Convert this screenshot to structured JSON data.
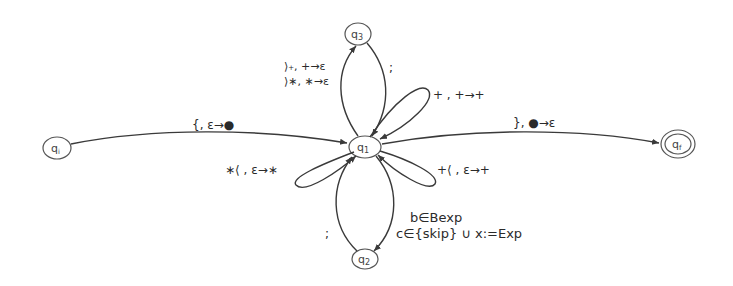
{
  "diagram": {
    "type": "pushdown automaton",
    "states": [
      {
        "id": "qi",
        "label": "qᵢ",
        "initial": true,
        "final": false
      },
      {
        "id": "q1",
        "label": "q₁",
        "initial": false,
        "final": false
      },
      {
        "id": "q2",
        "label": "q₂",
        "initial": false,
        "final": false
      },
      {
        "id": "q3",
        "label": "q₃",
        "initial": false,
        "final": false
      },
      {
        "id": "qf",
        "label": "q_f",
        "initial": false,
        "final": true
      }
    ],
    "transitions": [
      {
        "from": "qi",
        "to": "q1",
        "label": "{, ε→●"
      },
      {
        "from": "q1",
        "to": "qf",
        "label": "}, ●→ε"
      },
      {
        "from": "q1",
        "to": "q3",
        "label": "}₊, +→ε"
      },
      {
        "from": "q1",
        "to": "q3",
        "label2": "}∗, ∗→ε"
      },
      {
        "from": "q3",
        "to": "q1",
        "label": ";"
      },
      {
        "from": "q1",
        "to": "q1",
        "label": "+ , +→+"
      },
      {
        "from": "q1",
        "to": "q1",
        "label": "∗⟨ , ε→∗"
      },
      {
        "from": "q1",
        "to": "q1",
        "label": "+⟨ , ε→+"
      },
      {
        "from": "q1",
        "to": "q2",
        "label": "b∈Bexp",
        "label2": "c∈{skip} ∪ x:=Exp"
      },
      {
        "from": "q2",
        "to": "q1",
        "label": ";"
      }
    ]
  },
  "labels": {
    "qi": "q",
    "qi_sub": "i",
    "q1": "q",
    "q1_sub": "1",
    "q2": "q",
    "q2_sub": "2",
    "q3": "q",
    "q3_sub": "3",
    "qf": "q",
    "qf_sub": "f",
    "edge_qi_q1": "{, ε→●",
    "edge_q1_qf": "}, ●→ε",
    "edge_q1_q3_a": "⟩₊, +→ε",
    "edge_q1_q3_b": "⟩∗, ∗→ε",
    "edge_q3_q1": ";",
    "loop_plus": "+ , +→+",
    "loop_star_open": "∗⟨ , ε→∗",
    "loop_plus_open": "+⟨ , ε→+",
    "edge_q1_q2_a": "b∈Bexp",
    "edge_q1_q2_b": "c∈{skip} ∪ x:=Exp",
    "edge_q2_q1": ";"
  },
  "colors": {
    "line": "#3a3a3a",
    "background": "#ffffff"
  }
}
